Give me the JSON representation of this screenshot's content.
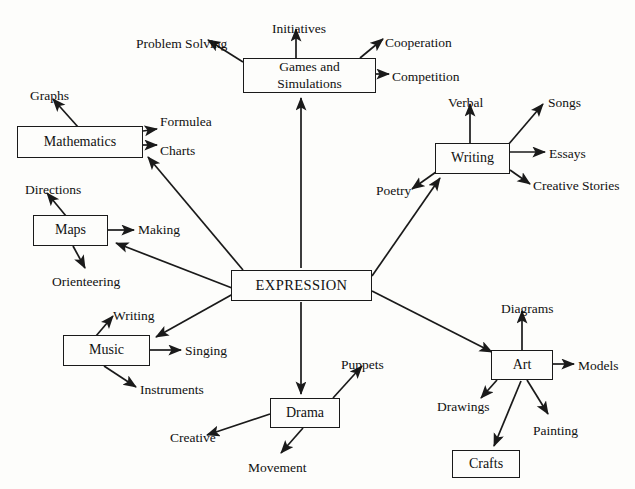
{
  "diagram": {
    "title": "EXPRESSION",
    "type": "mind-map",
    "center": {
      "label": "EXPRESSION",
      "x": 231,
      "y": 270,
      "w": 141,
      "h": 31
    },
    "branches": [
      {
        "label": "Mathematics",
        "x": 17,
        "y": 126,
        "w": 126,
        "h": 32,
        "leaves": [
          {
            "label": "Graphs",
            "x": 30,
            "y": 88,
            "anchor": "start"
          },
          {
            "label": "Formulea",
            "x": 160,
            "y": 114,
            "anchor": "start"
          },
          {
            "label": "Charts",
            "x": 160,
            "y": 143,
            "anchor": "start"
          }
        ]
      },
      {
        "label": "Maps",
        "x": 33,
        "y": 215,
        "w": 75,
        "h": 31,
        "leaves": [
          {
            "label": "Directions",
            "x": 25,
            "y": 182,
            "anchor": "start"
          },
          {
            "label": "Making",
            "x": 138,
            "y": 222,
            "anchor": "start"
          },
          {
            "label": "Orienteering",
            "x": 52,
            "y": 274,
            "anchor": "start"
          }
        ]
      },
      {
        "label": "Music",
        "x": 63,
        "y": 335,
        "w": 87,
        "h": 31,
        "leaves": [
          {
            "label": "Writing",
            "x": 113,
            "y": 308,
            "anchor": "start"
          },
          {
            "label": "Singing",
            "x": 185,
            "y": 343,
            "anchor": "start"
          },
          {
            "label": "Instruments",
            "x": 140,
            "y": 382,
            "anchor": "start"
          }
        ]
      },
      {
        "label": "Games and Simulations",
        "line1": "Games and",
        "line2": "Simulations",
        "x": 243,
        "y": 58,
        "w": 133,
        "h": 35,
        "leaves": [
          {
            "label": "Problem Solving",
            "x": 136,
            "y": 36,
            "anchor": "start"
          },
          {
            "label": "Initiatives",
            "x": 272,
            "y": 21,
            "anchor": "start"
          },
          {
            "label": "Cooperation",
            "x": 385,
            "y": 35,
            "anchor": "start"
          },
          {
            "label": "Competition",
            "x": 392,
            "y": 69,
            "anchor": "start"
          }
        ]
      },
      {
        "label": "Writing",
        "x": 435,
        "y": 143,
        "w": 75,
        "h": 31,
        "leaves": [
          {
            "label": "Verbal",
            "x": 448,
            "y": 95,
            "anchor": "start"
          },
          {
            "label": "Songs",
            "x": 548,
            "y": 95,
            "anchor": "start"
          },
          {
            "label": "Essays",
            "x": 549,
            "y": 146,
            "anchor": "start"
          },
          {
            "label": "Creative Stories",
            "x": 533,
            "y": 178,
            "anchor": "start"
          },
          {
            "label": "Poetry",
            "x": 376,
            "y": 183,
            "anchor": "start"
          }
        ]
      },
      {
        "label": "Art",
        "x": 491,
        "y": 350,
        "w": 62,
        "h": 30,
        "leaves": [
          {
            "label": "Diagrams",
            "x": 501,
            "y": 301,
            "anchor": "start"
          },
          {
            "label": "Models",
            "x": 578,
            "y": 358,
            "anchor": "start"
          },
          {
            "label": "Drawings",
            "x": 437,
            "y": 399,
            "anchor": "start"
          },
          {
            "label": "Painting",
            "x": 533,
            "y": 423,
            "anchor": "start"
          }
        ]
      },
      {
        "label": "Drama",
        "x": 270,
        "y": 398,
        "w": 70,
        "h": 30,
        "leaves": [
          {
            "label": "Puppets",
            "x": 341,
            "y": 357,
            "anchor": "start"
          },
          {
            "label": "Creative",
            "x": 170,
            "y": 430,
            "anchor": "start"
          },
          {
            "label": "Movement",
            "x": 248,
            "y": 460,
            "anchor": "start"
          }
        ]
      }
    ],
    "sub_boxes": [
      {
        "label": "Crafts",
        "x": 452,
        "y": 450,
        "w": 68,
        "h": 28,
        "parent": "Art"
      }
    ],
    "colors": {
      "stroke": "#1a1a1a",
      "text": "#111111",
      "background": "#fdfdfb"
    }
  }
}
